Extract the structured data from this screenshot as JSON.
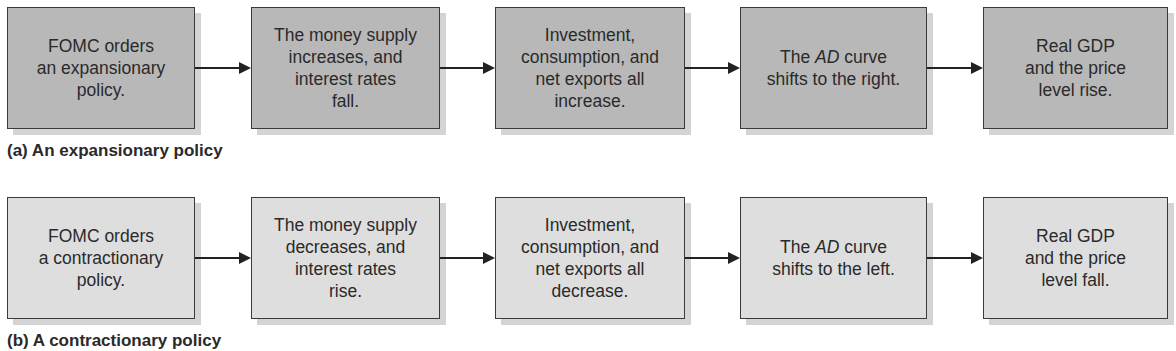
{
  "panels": [
    {
      "caption": "(a) An expansionary policy",
      "boxes": [
        {
          "pre": "FOMC orders\nan expansionary\npolicy.",
          "em": "",
          "post": ""
        },
        {
          "pre": "The money supply\nincreases, and\ninterest rates\nfall.",
          "em": "",
          "post": ""
        },
        {
          "pre": "Investment,\nconsumption, and\nnet exports all\nincrease.",
          "em": "",
          "post": ""
        },
        {
          "pre": "The ",
          "em": "AD",
          "post": " curve\nshifts to the right."
        },
        {
          "pre": "Real GDP\nand the price\nlevel rise.",
          "em": "",
          "post": ""
        }
      ],
      "fill": "#b8b8b8"
    },
    {
      "caption": "(b) A contractionary policy",
      "boxes": [
        {
          "pre": "FOMC orders\na contractionary\npolicy.",
          "em": "",
          "post": ""
        },
        {
          "pre": "The money supply\ndecreases, and\ninterest rates\nrise.",
          "em": "",
          "post": ""
        },
        {
          "pre": "Investment,\nconsumption, and\nnet exports all\ndecrease.",
          "em": "",
          "post": ""
        },
        {
          "pre": "The ",
          "em": "AD",
          "post": " curve\nshifts to the left."
        },
        {
          "pre": "Real GDP\nand the price\nlevel fall.",
          "em": "",
          "post": ""
        }
      ],
      "fill": "#dedede"
    }
  ]
}
